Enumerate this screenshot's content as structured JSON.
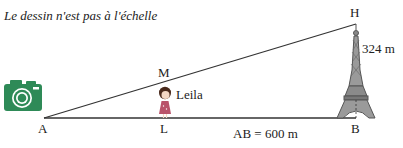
{
  "note": "Le dessin n'est pas à l'échelle",
  "points": {
    "A": "A",
    "L": "L",
    "M": "M",
    "B": "B",
    "H": "H"
  },
  "labels": {
    "person": "Leila",
    "height": "324 m",
    "distance": "AB = 600 m"
  },
  "icons": {
    "camera": "camera-icon",
    "person": "girl-icon",
    "tower": "eiffel-tower-icon"
  },
  "colors": {
    "camera": "#2e8a57",
    "lines": "#333333",
    "dress": "#b9536a",
    "hair": "#4a2a1c"
  }
}
